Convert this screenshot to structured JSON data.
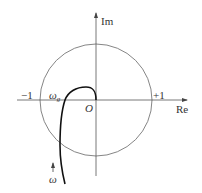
{
  "diagram": {
    "type": "nyquist-plot",
    "axes": {
      "imag_label": "Im",
      "real_label": "Re",
      "origin_label": "O"
    },
    "unit_circle": {
      "neg_label": "−1",
      "pos_label": "+1"
    },
    "curve": {
      "crossover_label": "ω",
      "crossover_sub": "g",
      "direction_label": "ω"
    },
    "colors": {
      "axis": "#555555",
      "circle": "#777777",
      "curve": "#111111",
      "text": "#333333"
    }
  }
}
